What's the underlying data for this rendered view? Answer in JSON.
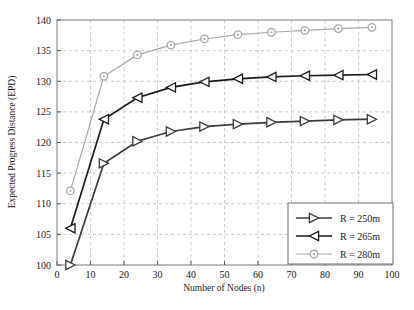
{
  "chart_data": {
    "type": "line",
    "title": "",
    "xlabel": "Number of Nodes (n)",
    "ylabel": "Expected Progress Distance (EPD)",
    "xlim": [
      0,
      100
    ],
    "ylim": [
      100,
      140
    ],
    "xticks": [
      0,
      10,
      20,
      30,
      40,
      50,
      60,
      70,
      80,
      90,
      100
    ],
    "yticks": [
      100,
      105,
      110,
      115,
      120,
      125,
      130,
      135,
      140
    ],
    "xtick_labels": [
      "0",
      "10",
      "20",
      "30",
      "40",
      "50",
      "60",
      "70",
      "80",
      "90",
      "100"
    ],
    "ytick_labels": [
      "100",
      "105",
      "110",
      "115",
      "120",
      "125",
      "130",
      "135",
      "140"
    ],
    "grid": true,
    "grid_style": "dashed",
    "legend_position": "lower-right",
    "series": [
      {
        "name": "R = 250m",
        "marker": "triangle-right",
        "color": "#3c3c3c",
        "x": [
          4,
          14,
          24,
          34,
          44,
          54,
          64,
          74,
          84,
          94
        ],
        "y": [
          100.0,
          116.6,
          120.2,
          121.8,
          122.6,
          123.0,
          123.3,
          123.5,
          123.7,
          123.8
        ]
      },
      {
        "name": "R = 265m",
        "marker": "triangle-left",
        "color": "#1a1a1a",
        "x": [
          4,
          14,
          24,
          34,
          44,
          54,
          64,
          74,
          84,
          94
        ],
        "y": [
          106.0,
          123.8,
          127.3,
          129.0,
          129.9,
          130.4,
          130.7,
          130.9,
          131.0,
          131.1
        ]
      },
      {
        "name": "R = 280m",
        "marker": "circle",
        "color": "#a8a8a8",
        "x": [
          4,
          14,
          24,
          34,
          44,
          54,
          64,
          74,
          84,
          94
        ],
        "y": [
          112.1,
          130.8,
          134.3,
          135.9,
          136.9,
          137.6,
          138.0,
          138.3,
          138.6,
          138.8
        ]
      }
    ]
  },
  "legend": {
    "items": [
      {
        "label": "R = 250m",
        "marker": "triangle-right",
        "color": "#3c3c3c"
      },
      {
        "label": "R = 265m",
        "marker": "triangle-left",
        "color": "#1a1a1a"
      },
      {
        "label": "R = 280m",
        "marker": "circle",
        "color": "#a8a8a8"
      }
    ]
  },
  "caption": {
    "text": ""
  }
}
